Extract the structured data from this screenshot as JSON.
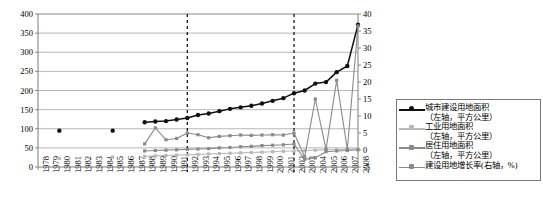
{
  "chart_data": {
    "type": "line",
    "title": "",
    "xlabel": "",
    "ylabel_left": "平方公里",
    "ylabel_right": "%",
    "grid": true,
    "legend_position": "right",
    "x": [
      1978,
      1979,
      1980,
      1981,
      1982,
      1983,
      1984,
      1985,
      1986,
      1987,
      1988,
      1989,
      1990,
      1991,
      1992,
      1993,
      1994,
      1995,
      1996,
      1997,
      1998,
      1999,
      2000,
      2001,
      2002,
      2003,
      2004,
      2005,
      2006,
      2007,
      2008
    ],
    "xticklabels": [
      "1978",
      "1979",
      "1980",
      "1981",
      "1982",
      "1983",
      "1984",
      "1985",
      "1986",
      "1987",
      "1988",
      "1989",
      "1990",
      "1991",
      "1992",
      "1993",
      "1994",
      "1995",
      "1996",
      "1997",
      "1998",
      "1999",
      "2000",
      "2001",
      "2002",
      "2003",
      "2004",
      "2005",
      "2006",
      "2007",
      "2008"
    ],
    "ylim_left": [
      0,
      400
    ],
    "yticks_left": [
      0,
      50,
      100,
      150,
      200,
      250,
      300,
      350,
      400
    ],
    "ylim_right": [
      -5,
      40
    ],
    "yticks_right": [
      -5,
      0,
      5,
      10,
      15,
      20,
      25,
      30,
      35,
      40
    ],
    "annotations": [
      {
        "type": "vline",
        "x": 1992,
        "style": "dashed"
      },
      {
        "type": "vline",
        "x": 2002,
        "style": "dashed"
      }
    ],
    "series": [
      {
        "name": "城市建设用地面积",
        "axis": "left",
        "unit": "平方公里",
        "color": "#111111",
        "marker": "circle",
        "values": [
          null,
          null,
          95,
          null,
          null,
          null,
          null,
          95,
          null,
          null,
          117,
          119,
          120,
          124,
          128,
          136,
          140,
          146,
          152,
          156,
          160,
          166,
          173,
          180,
          193,
          200,
          218,
          222,
          248,
          264,
          372
        ]
      },
      {
        "name": "工业用地面积",
        "axis": "left",
        "unit": "平方公里",
        "color": "#b9b9b9",
        "marker": "square",
        "values": [
          null,
          null,
          22,
          null,
          null,
          null,
          null,
          26,
          null,
          null,
          28,
          29,
          30,
          31,
          32,
          33,
          34,
          35,
          36,
          37,
          38,
          39,
          40,
          41,
          42,
          43,
          44,
          45,
          45,
          46,
          47
        ]
      },
      {
        "name": "居住用地面积",
        "axis": "left",
        "unit": "平方公里",
        "color": "#8a8a8a",
        "marker": "square",
        "values": [
          null,
          null,
          null,
          null,
          null,
          null,
          null,
          null,
          null,
          null,
          42,
          43,
          44,
          45,
          46,
          47,
          48,
          50,
          51,
          53,
          54,
          56,
          57,
          58,
          60,
          20,
          24,
          40,
          42,
          43,
          45
        ]
      },
      {
        "name": "建设用地增长率",
        "axis": "right",
        "unit": "%",
        "color": "#8a8a8a",
        "marker": "square",
        "values": [
          null,
          null,
          null,
          null,
          null,
          null,
          null,
          null,
          null,
          null,
          1.8,
          6.5,
          3.0,
          3.4,
          5.0,
          4.5,
          3.6,
          4.0,
          4.2,
          4.4,
          4.3,
          4.4,
          4.5,
          4.4,
          5.0,
          -2.0,
          15.0,
          0.2,
          20.5,
          0.2,
          36.5
        ]
      }
    ]
  },
  "legend": {
    "entries": [
      {
        "label": "城市建设用地面积",
        "sub": "（左轴，平方公里）"
      },
      {
        "label": "工业用地面积",
        "sub": "（左轴，平方公里）"
      },
      {
        "label": "居住用地面积",
        "sub": "（左轴，平方公里）"
      },
      {
        "label": "建设用地增长率(右轴，%)",
        "sub": ""
      }
    ]
  },
  "colors": {
    "series1": "#111111",
    "series2": "#b9b9b9",
    "series3": "#8a8a8a",
    "series4": "#8a8a8a",
    "grid": "#9a9a9a",
    "axis": "#6e6e6e"
  }
}
